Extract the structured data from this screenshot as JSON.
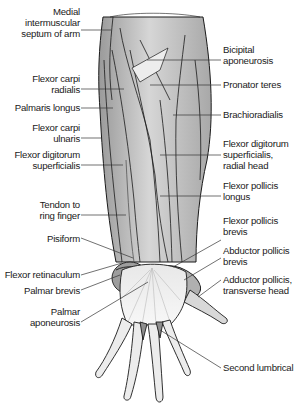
{
  "figure": {
    "colors": {
      "muscle_fill": "#b9b9b9",
      "muscle_light": "#dcdcdc",
      "tendon_fill": "#efefef",
      "outline": "#1a1a1a",
      "leader_line": "#333333",
      "background": "#ffffff"
    }
  },
  "labels_left": [
    {
      "id": "medial-intermuscular-septum",
      "lines": [
        "Medial",
        "intermuscular",
        "septum of arm"
      ]
    },
    {
      "id": "flexor-carpi-radialis",
      "lines": [
        "Flexor carpi",
        "radialis"
      ]
    },
    {
      "id": "palmaris-longus",
      "lines": [
        "Palmaris longus"
      ]
    },
    {
      "id": "flexor-carpi-ulnaris",
      "lines": [
        "Flexor carpi",
        "ulnaris"
      ]
    },
    {
      "id": "flexor-digitorum-superficialis",
      "lines": [
        "Flexor digitorum",
        "superficialis"
      ]
    },
    {
      "id": "tendon-to-ring-finger",
      "lines": [
        "Tendon to",
        "ring finger"
      ]
    },
    {
      "id": "pisiform",
      "lines": [
        "Pisiform"
      ]
    },
    {
      "id": "flexor-retinaculum",
      "lines": [
        "Flexor retinaculum"
      ]
    },
    {
      "id": "palmar-brevis",
      "lines": [
        "Palmar brevis"
      ]
    },
    {
      "id": "palmar-aponeurosis",
      "lines": [
        "Palmar",
        "aponeurosis"
      ]
    }
  ],
  "labels_right": [
    {
      "id": "bicipital-aponeurosis",
      "lines": [
        "Bicipital",
        "aponeurosis"
      ]
    },
    {
      "id": "pronator-teres",
      "lines": [
        "Pronator teres"
      ]
    },
    {
      "id": "brachioradialis",
      "lines": [
        "Brachioradialis"
      ]
    },
    {
      "id": "fds-radial-head",
      "lines": [
        "Flexor digitorum",
        "superficialis,",
        "radial head"
      ]
    },
    {
      "id": "flexor-pollicis-longus",
      "lines": [
        "Flexor pollicis",
        "longus"
      ]
    },
    {
      "id": "flexor-pollicis-brevis",
      "lines": [
        "Flexor pollicis",
        "brevis"
      ]
    },
    {
      "id": "abductor-pollicis-brevis",
      "lines": [
        "Abductor pollicis",
        "brevis"
      ]
    },
    {
      "id": "adductor-pollicis-transverse",
      "lines": [
        "Adductor pollicis,",
        "transverse head"
      ]
    },
    {
      "id": "second-lumbrical",
      "lines": [
        "Second lumbrical"
      ]
    }
  ]
}
